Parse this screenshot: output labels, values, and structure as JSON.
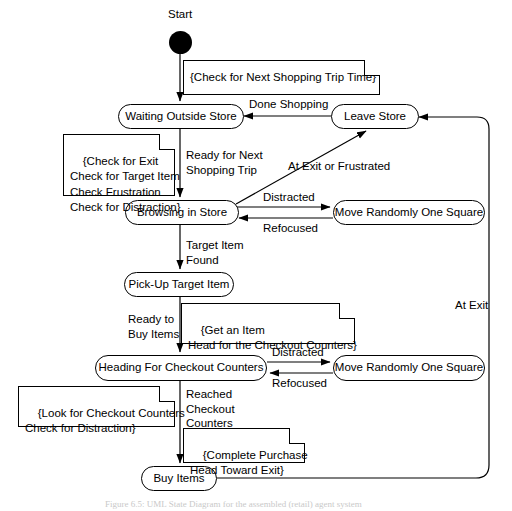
{
  "diagram": {
    "start_label": "Start",
    "caption": "Figure 6.5: UML State Diagram for the assembled (retail) agent system"
  },
  "states": [
    {
      "id": "waiting-outside-store",
      "label": "Waiting Outside Store"
    },
    {
      "id": "leave-store",
      "label": "Leave Store"
    },
    {
      "id": "browsing-in-store",
      "label": "Browsing in Store"
    },
    {
      "id": "move-randomly-browse",
      "label": "Move Randomly One Square"
    },
    {
      "id": "pick-up-target-item",
      "label": "Pick-Up Target Item"
    },
    {
      "id": "heading-for-checkout",
      "label": "Heading For Checkout Counters"
    },
    {
      "id": "move-randomly-checkout",
      "label": "Move Randomly One Square"
    },
    {
      "id": "buy-items",
      "label": "Buy Items"
    }
  ],
  "notes": [
    {
      "id": "note-check-next-trip",
      "text": "{Check for Next Shopping Trip Time}"
    },
    {
      "id": "note-browsing-actions",
      "text": "{Check for Exit\nCheck for Target Item\nCheck Frustration\nCheck for Distraction}"
    },
    {
      "id": "note-get-item",
      "text": "{Get an Item\nHead for the Checkout Counters}"
    },
    {
      "id": "note-look-checkout",
      "text": "{Look for Checkout Counters\nCheck for Distraction}"
    },
    {
      "id": "note-complete-purchase",
      "text": "{Complete Purchase\nHead Toward Exit}"
    }
  ],
  "transitions": [
    {
      "id": "done-shopping",
      "label": "Done Shopping"
    },
    {
      "id": "ready-for-next-trip",
      "label": "Ready for Next\nShopping Trip"
    },
    {
      "id": "at-exit-or-frustrated",
      "label": "At Exit or Frustrated"
    },
    {
      "id": "distracted-browsing",
      "label": "Distracted"
    },
    {
      "id": "refocused-browsing",
      "label": "Refocused"
    },
    {
      "id": "target-item-found",
      "label": "Target Item\nFound"
    },
    {
      "id": "ready-to-buy-items",
      "label": "Ready to\nBuy Items"
    },
    {
      "id": "distracted-checkout",
      "label": "Distracted"
    },
    {
      "id": "refocused-checkout",
      "label": "Refocused"
    },
    {
      "id": "reached-checkout-counters",
      "label": "Reached\nCheckout\nCounters"
    },
    {
      "id": "at-exit",
      "label": "At Exit"
    }
  ],
  "colors": {
    "stroke": "#000000",
    "background": "#ffffff",
    "caption_text": "#c9c9c9"
  }
}
